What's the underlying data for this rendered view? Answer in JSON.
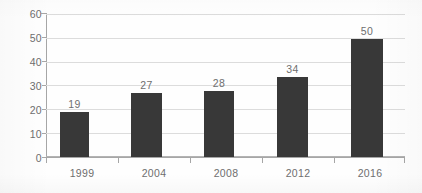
{
  "chart_data": {
    "type": "bar",
    "title": "",
    "subtitle": "",
    "xlabel": "",
    "ylabel": "",
    "categories": [
      "1999",
      "2004",
      "2008",
      "2012",
      "2016"
    ],
    "values": [
      19,
      27,
      28,
      34,
      50
    ],
    "data_labels": [
      "19",
      "27",
      "28",
      "34",
      "50"
    ],
    "ylim": [
      0,
      60
    ],
    "y_ticks": [
      60,
      50,
      40,
      30,
      20,
      10,
      0
    ],
    "y_tick_labels": [
      "60",
      "50",
      "40",
      "30",
      "20",
      "10",
      "0"
    ],
    "grid": "horizontal",
    "legend": "none",
    "series": [
      {
        "name": "",
        "values": [
          19,
          27,
          28,
          34,
          50
        ]
      }
    ],
    "colors": {
      "bar": "#383838",
      "gridline": "#dcdcdc",
      "axis": "#a6a6a6",
      "tick_text": "#6e6e6e",
      "background": "#fefefe"
    }
  }
}
